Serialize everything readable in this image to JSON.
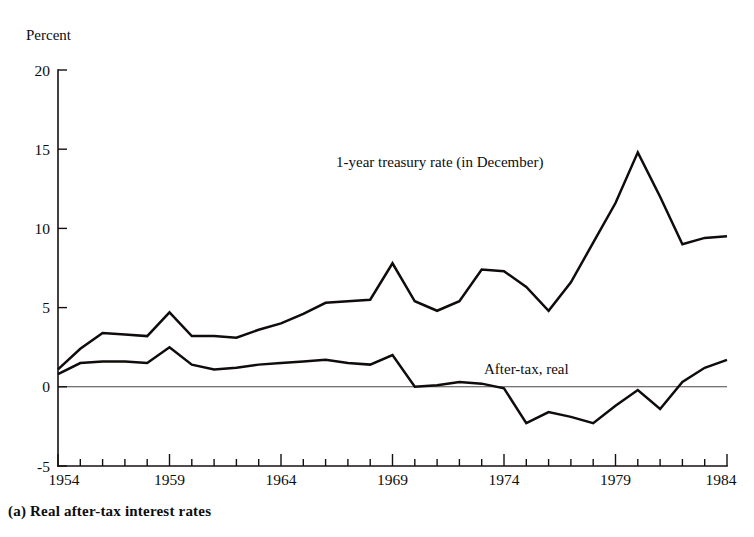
{
  "figure": {
    "caption": "(a) Real after-tax interest rates",
    "axis_unit_label": "Percent"
  },
  "chart_data": {
    "type": "line",
    "title": "",
    "subtitle": "",
    "xlabel": "",
    "ylabel": "Percent",
    "xlim": [
      1954,
      1984
    ],
    "ylim": [
      -5,
      20
    ],
    "yticks": [
      -5,
      0,
      5,
      10,
      15,
      20
    ],
    "ytick_labels": [
      "-5",
      "0",
      "5",
      "10",
      "15",
      "20"
    ],
    "xticks": [
      1954,
      1955,
      1956,
      1957,
      1958,
      1959,
      1960,
      1961,
      1962,
      1963,
      1964,
      1965,
      1966,
      1967,
      1968,
      1969,
      1970,
      1971,
      1972,
      1973,
      1974,
      1975,
      1976,
      1977,
      1978,
      1979,
      1980,
      1981,
      1982,
      1983,
      1984
    ],
    "xtick_labels": [
      "1954",
      "1959",
      "1964",
      "1969",
      "1974",
      "1979",
      "1984"
    ],
    "labeled_xticks": [
      1954,
      1959,
      1964,
      1969,
      1974,
      1979,
      1984
    ],
    "grid": false,
    "legend_position": "inline-annotation",
    "zero_line": true,
    "x": [
      1954,
      1955,
      1956,
      1957,
      1958,
      1959,
      1960,
      1961,
      1962,
      1963,
      1964,
      1965,
      1966,
      1967,
      1968,
      1969,
      1970,
      1971,
      1972,
      1973,
      1974,
      1975,
      1976,
      1977,
      1978,
      1979,
      1980,
      1981,
      1982,
      1983,
      1984
    ],
    "series": [
      {
        "name": "1-year treasury rate (in December)",
        "annotation": "1-year treasury rate (in December)",
        "color": "#100c0b",
        "values": [
          1.1,
          2.4,
          3.4,
          3.3,
          3.2,
          4.7,
          3.2,
          3.2,
          3.1,
          3.6,
          4.0,
          4.6,
          5.3,
          5.4,
          5.5,
          7.8,
          5.4,
          4.8,
          5.4,
          7.4,
          7.3,
          6.3,
          4.8,
          6.6,
          9.1,
          11.6,
          14.8,
          12.0,
          9.0,
          9.4,
          9.5
        ]
      },
      {
        "name": "After-tax, real",
        "annotation": "After-tax, real",
        "color": "#100c0b",
        "values": [
          0.8,
          1.5,
          1.6,
          1.6,
          1.5,
          2.5,
          1.4,
          1.1,
          1.2,
          1.4,
          1.5,
          1.6,
          1.7,
          1.5,
          1.4,
          2.0,
          0.0,
          0.1,
          0.3,
          0.2,
          -0.1,
          -2.3,
          -1.6,
          -1.9,
          -2.3,
          -1.2,
          -0.2,
          -1.4,
          0.3,
          1.2,
          1.7
        ]
      }
    ],
    "annotations": [
      {
        "text": "1-year treasury rate (in December)",
        "x_px": 336,
        "y_px": 167
      },
      {
        "text": "After-tax, real",
        "x_px": 484,
        "y_px": 374
      },
      {
        "text": "Percent",
        "x_px": 26,
        "y_px": 40
      }
    ]
  }
}
